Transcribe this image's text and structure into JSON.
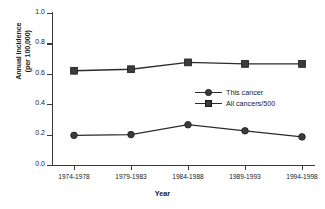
{
  "chart_data": {
    "type": "line",
    "title": "",
    "xlabel": "Year",
    "ylabel_line1": "Annual incidence",
    "ylabel_line2": "(per 100,000)",
    "categories": [
      "1974-1978",
      "1979-1983",
      "1984-1988",
      "1989-1993",
      "1994-1998"
    ],
    "series": [
      {
        "name": "This cancer",
        "marker": "circle",
        "color": "#3b3b3b",
        "values": [
          0.195,
          0.2,
          0.265,
          0.225,
          0.185
        ]
      },
      {
        "name": "All cancers/500",
        "marker": "square",
        "color": "#3b3b3b",
        "values": [
          0.62,
          0.63,
          0.675,
          0.665,
          0.665
        ]
      }
    ],
    "ylim": [
      0.0,
      1.0
    ],
    "yticks": [
      "0.0",
      "0.2",
      "0.4",
      "0.6",
      "0.8",
      "1.0"
    ],
    "ytick_values": [
      0.0,
      0.2,
      0.4,
      0.6,
      0.8,
      1.0
    ],
    "grid": false,
    "legend_position": "center-right-inside",
    "line_color": "#2b2b2b",
    "axis_color": "#3a3a3a",
    "background": "#ffffff"
  }
}
